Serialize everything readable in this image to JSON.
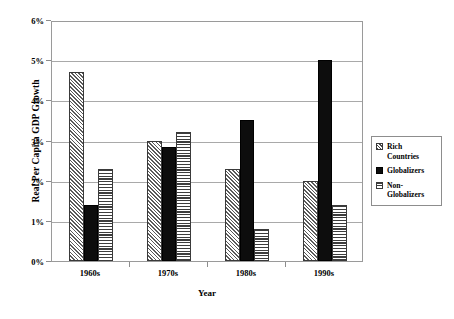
{
  "chart_data": {
    "type": "bar",
    "title": "",
    "xlabel": "Year",
    "ylabel": "Real Per Capita GDP Growth",
    "categories": [
      "1960s",
      "1970s",
      "1980s",
      "1990s"
    ],
    "series": [
      {
        "name": "Rich Countries",
        "pattern": "diagonal-hatch",
        "values": [
          4.7,
          3.0,
          2.3,
          2.0
        ]
      },
      {
        "name": "Globalizers",
        "pattern": "solid-black",
        "values": [
          1.4,
          2.85,
          3.5,
          5.0
        ]
      },
      {
        "name": "Non-Globalizers",
        "pattern": "horizontal-stripes",
        "values": [
          2.3,
          3.2,
          0.8,
          1.4
        ]
      }
    ],
    "ylim": [
      0,
      6
    ],
    "y_ticks": [
      "0%",
      "1%",
      "2%",
      "3%",
      "4%",
      "5%",
      "6%"
    ],
    "y_tick_values": [
      0,
      1,
      2,
      3,
      4,
      5,
      6
    ],
    "grid": true,
    "legend_position": "right"
  },
  "legend": {
    "entries": [
      {
        "label_line1": "Rich",
        "label_line2": "Countries"
      },
      {
        "label_line1": "Globalizers",
        "label_line2": ""
      },
      {
        "label_line1": "Non-",
        "label_line2": "Globalizers"
      }
    ]
  },
  "caption": {
    "text": ""
  }
}
